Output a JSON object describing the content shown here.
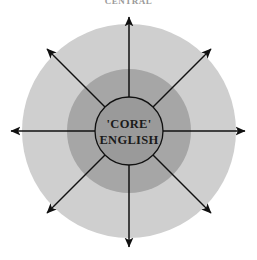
{
  "figure": {
    "title": "CENTRAL",
    "caption_visible": false
  },
  "core": {
    "line1": "'CORE'",
    "line2": "ENGLISH"
  },
  "colors": {
    "background": "#ffffff",
    "outer_ring_fill": "#cfcfcf",
    "middle_ring_fill": "#a6a6a6",
    "core_fill": "#9a9a9a",
    "stroke": "#111111",
    "title_text": "#9a9a9a",
    "core_text": "#1a1a1a"
  },
  "geometry": {
    "canvas_width": 257,
    "canvas_height": 260,
    "center_x": 129,
    "center_y": 131,
    "outer_radius": 107,
    "middle_radius": 62,
    "core_radius": 34,
    "arrow_tip_radius": 116
  },
  "arrows": [
    {
      "name": "arrow-north",
      "angle_deg": 270,
      "label": ""
    },
    {
      "name": "arrow-northeast",
      "angle_deg": 315,
      "label": ""
    },
    {
      "name": "arrow-east",
      "angle_deg": 0,
      "label": ""
    },
    {
      "name": "arrow-southeast",
      "angle_deg": 45,
      "label": ""
    },
    {
      "name": "arrow-south",
      "angle_deg": 90,
      "label": ""
    },
    {
      "name": "arrow-southwest",
      "angle_deg": 135,
      "label": ""
    },
    {
      "name": "arrow-west",
      "angle_deg": 180,
      "label": ""
    },
    {
      "name": "arrow-northwest",
      "angle_deg": 225,
      "label": ""
    }
  ]
}
